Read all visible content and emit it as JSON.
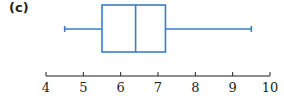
{
  "panel_label": "(c)",
  "colors": {
    "box": "#3a7dc9",
    "axis": "#231f20"
  },
  "chart_data": {
    "type": "boxplot",
    "title": "",
    "xlabel": "",
    "ylabel": "",
    "xlim": [
      4,
      10
    ],
    "ticks": [
      4,
      5,
      6,
      7,
      8,
      9,
      10
    ],
    "tick_labels": [
      "4",
      "5",
      "6",
      "7",
      "8",
      "9",
      "10"
    ],
    "grid": false,
    "min": 4.5,
    "q1": 5.5,
    "median": 6.4,
    "q3": 7.2,
    "max": 9.5
  }
}
